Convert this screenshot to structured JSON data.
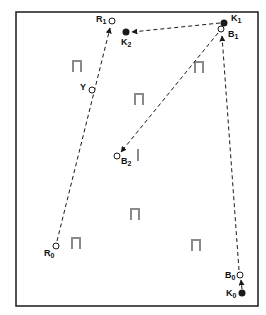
{
  "diagram": {
    "frame": {
      "x": 16,
      "y": 12,
      "w": 242,
      "h": 294
    },
    "colors": {
      "line": "#1a1a1a",
      "marker": "#8a8a8a",
      "background": "#ffffff"
    },
    "points": [
      {
        "id": "R1",
        "letter": "R",
        "sub": "1",
        "type": "open",
        "x": 112,
        "y": 21,
        "lx": 96,
        "ly": 15
      },
      {
        "id": "K2",
        "letter": "K",
        "sub": "2",
        "type": "filled",
        "x": 126,
        "y": 32,
        "lx": 121,
        "ly": 38
      },
      {
        "id": "K1",
        "letter": "K",
        "sub": "1",
        "type": "filled",
        "x": 224,
        "y": 23,
        "lx": 231,
        "ly": 14
      },
      {
        "id": "B1",
        "letter": "B",
        "sub": "1",
        "type": "open",
        "x": 221,
        "y": 29,
        "lx": 228,
        "ly": 30
      },
      {
        "id": "Y",
        "letter": "Y",
        "sub": "",
        "type": "open",
        "x": 92,
        "y": 90,
        "lx": 80,
        "ly": 83
      },
      {
        "id": "B2",
        "letter": "B",
        "sub": "2",
        "type": "open",
        "x": 117,
        "y": 156,
        "lx": 121,
        "ly": 157
      },
      {
        "id": "R0",
        "letter": "R",
        "sub": "0",
        "type": "open",
        "x": 56,
        "y": 246,
        "lx": 44,
        "ly": 249
      },
      {
        "id": "B0",
        "letter": "B",
        "sub": "0",
        "type": "open",
        "x": 240,
        "y": 275,
        "lx": 225,
        "ly": 271
      },
      {
        "id": "K0",
        "letter": "K",
        "sub": "0",
        "type": "filled",
        "x": 242,
        "y": 293,
        "lx": 226,
        "ly": 289
      }
    ],
    "arrows": [
      {
        "from": "R0",
        "to": "R1",
        "x1": 57,
        "y1": 241,
        "x2": 110,
        "y2": 28
      },
      {
        "from": "K1",
        "to": "K2",
        "x1": 220,
        "y1": 23,
        "x2": 132,
        "y2": 32
      },
      {
        "from": "B1",
        "to": "B2",
        "x1": 218,
        "y1": 33,
        "x2": 121,
        "y2": 152
      },
      {
        "from": "B0",
        "to": "B1",
        "x1": 239,
        "y1": 270,
        "x2": 222,
        "y2": 36
      },
      {
        "from": "K0",
        "to": "B0",
        "x1": 242,
        "y1": 289,
        "x2": 241,
        "y2": 280
      }
    ],
    "markers": [
      {
        "type": "gate",
        "x": 77,
        "y": 66
      },
      {
        "type": "gate",
        "x": 139,
        "y": 99
      },
      {
        "type": "gate",
        "x": 199,
        "y": 67
      },
      {
        "type": "bar",
        "x": 138,
        "y": 155
      },
      {
        "type": "gate",
        "x": 135,
        "y": 214
      },
      {
        "type": "gate",
        "x": 76,
        "y": 243
      },
      {
        "type": "gate",
        "x": 196,
        "y": 245
      }
    ]
  }
}
